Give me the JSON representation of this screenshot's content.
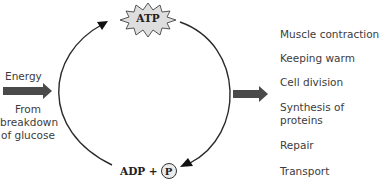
{
  "diagram": {
    "type": "cycle",
    "cycle_top": {
      "label": "ATP",
      "shape": "starburst",
      "fill": "#dcdcdc"
    },
    "cycle_bottom": {
      "label_adp": "ADP +",
      "label_p": "P",
      "p_shape": "circle"
    },
    "input": {
      "label_top": "Energy",
      "label_bottom_lines": [
        "From",
        "breakdown",
        "of glucose"
      ],
      "arrow_color": "#444444"
    },
    "output": {
      "arrow_color": "#444444",
      "uses": [
        {
          "label_lines": [
            "Muscle contraction"
          ]
        },
        {
          "label_lines": [
            "Keeping warm"
          ]
        },
        {
          "label_lines": [
            "Cell division"
          ]
        },
        {
          "label_lines": [
            "Synthesis of",
            "proteins"
          ]
        },
        {
          "label_lines": [
            "Repair"
          ]
        },
        {
          "label_lines": [
            "Transport"
          ]
        }
      ]
    },
    "cycle_arrows": [
      {
        "name": "left-arc",
        "direction": "ADP+P to ATP",
        "arrowhead": "top-left"
      },
      {
        "name": "right-arc",
        "direction": "ATP to ADP+P",
        "arrowhead": "bottom-right"
      }
    ]
  }
}
